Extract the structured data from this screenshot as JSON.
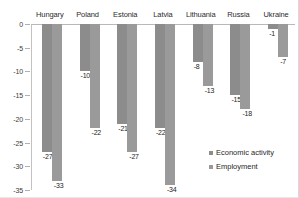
{
  "chart_data": {
    "type": "bar",
    "title": "",
    "subtitle": "",
    "xlabel": "",
    "ylabel": "",
    "ylim": [
      -35,
      0
    ],
    "ytick_labels": [
      "0",
      "-5",
      "-10",
      "-15",
      "-20",
      "-25",
      "-30",
      "-35"
    ],
    "ytick_values": [
      0,
      -5,
      -10,
      -15,
      -20,
      -25,
      -30,
      -35
    ],
    "grid": false,
    "legend_position": "bottom-right",
    "categories": [
      "Hungary",
      "Poland",
      "Estonia",
      "Latvia",
      "Lithuania",
      "Russia",
      "Ukraine"
    ],
    "series": [
      {
        "name": "Economic activity",
        "color": "#8c8c8c",
        "values": [
          -27,
          -10,
          -21,
          -22,
          -8,
          -15,
          -1
        ],
        "labels": [
          "-27",
          "-10",
          "-21",
          "-22",
          "-8",
          "-15",
          "-1"
        ]
      },
      {
        "name": "Employment",
        "color": "#9a9a9a",
        "values": [
          -33,
          -22,
          -27,
          -34,
          -13,
          -18,
          -7
        ],
        "labels": [
          "-33",
          "-22",
          "-27",
          "-34",
          "-13",
          "-18",
          "-7"
        ]
      }
    ]
  },
  "legend": {
    "items": [
      {
        "label": "Economic activity",
        "color": "#8c8c8c"
      },
      {
        "label": "Employment",
        "color": "#9a9a9a"
      }
    ]
  }
}
